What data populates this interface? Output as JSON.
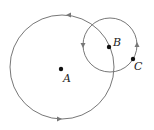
{
  "diagram": {
    "type": "geometry",
    "points": [
      {
        "id": "A",
        "label": "A",
        "x": 61,
        "y": 69
      },
      {
        "id": "B",
        "label": "B",
        "x": 109,
        "y": 47
      },
      {
        "id": "C",
        "label": "C",
        "x": 133,
        "y": 59
      }
    ],
    "circles": [
      {
        "name": "large-circle",
        "cx": 62,
        "cy": 67,
        "r": 52
      },
      {
        "name": "small-circle",
        "cx": 110,
        "cy": 45,
        "r": 27
      }
    ],
    "stroke_color": "#777777",
    "point_color": "#111111"
  }
}
